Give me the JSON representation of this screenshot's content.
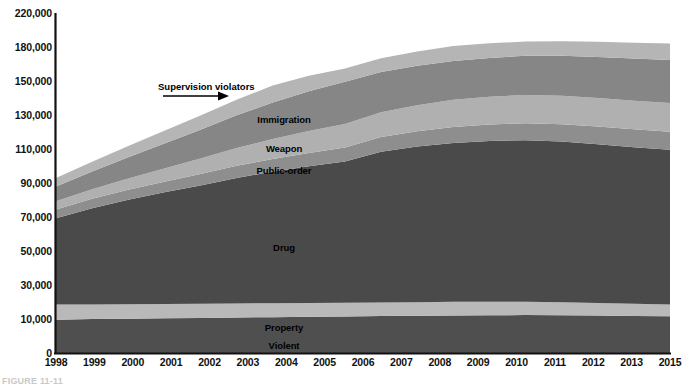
{
  "figure": {
    "caption": "FIGURE 11-11"
  },
  "chart_data": {
    "type": "area",
    "title": "",
    "subtitle": "",
    "xlabel": "",
    "ylabel": "",
    "stacked": true,
    "grid": false,
    "legend_position": "inline-labels",
    "ylim": [
      0,
      220000
    ],
    "ytick_labels": [
      "0",
      "10,000",
      "30,000",
      "50,000",
      "70,000",
      "90,000",
      "110,000",
      "130,000",
      "150,000",
      "180,000",
      "220,000"
    ],
    "ytick_values": [
      0,
      10000,
      30000,
      50000,
      70000,
      90000,
      110000,
      130000,
      150000,
      180000,
      220000
    ],
    "xtick_labels": [
      "1998",
      "1999",
      "2000",
      "2001",
      "2002",
      "2003",
      "2004",
      "2005",
      "2006",
      "2007",
      "2008",
      "2009",
      "2010",
      "2011",
      "2012",
      "2013",
      "2015"
    ],
    "x": [
      1998,
      1999,
      2000,
      2001,
      2002,
      2003,
      2004,
      2005,
      2006,
      2007,
      2008,
      2009,
      2010,
      2011,
      2012,
      2013,
      2014,
      2015
    ],
    "series": [
      {
        "name": "Violent",
        "color": "#4f4f4f",
        "values": [
          9800,
          10000,
          10200,
          10400,
          10600,
          10900,
          11100,
          11300,
          11500,
          11700,
          11900,
          12100,
          12200,
          12300,
          12200,
          12000,
          11800,
          11600
        ]
      },
      {
        "name": "Property",
        "color": "#b9b9b9",
        "values": [
          8700,
          8600,
          8500,
          8400,
          8300,
          8200,
          8200,
          8100,
          8100,
          8000,
          8000,
          8000,
          7900,
          7800,
          7600,
          7400,
          7200,
          7000
        ]
      },
      {
        "name": "Drug",
        "color": "#4a4a4a",
        "values": [
          50800,
          56600,
          61400,
          65700,
          69700,
          73900,
          77300,
          80400,
          83100,
          88700,
          91600,
          93500,
          94600,
          95100,
          94600,
          93400,
          92100,
          91000
        ]
      },
      {
        "name": "Public-order",
        "color": "#8e8e8e",
        "values": [
          5100,
          5500,
          5900,
          6300,
          6700,
          7100,
          7500,
          7900,
          8200,
          8600,
          9000,
          9400,
          9700,
          10000,
          10200,
          10400,
          10500,
          10600
        ]
      },
      {
        "name": "Weapon",
        "color": "#b0b0b0",
        "values": [
          4800,
          5600,
          6600,
          7700,
          9100,
          10500,
          11800,
          12900,
          13800,
          14600,
          15300,
          15900,
          16300,
          16600,
          16700,
          16800,
          16800,
          16800
        ]
      },
      {
        "name": "Immigration",
        "color": "#868686",
        "values": [
          8800,
          10500,
          12600,
          14700,
          16900,
          19200,
          21400,
          23300,
          24900,
          26300,
          27600,
          28800,
          29700,
          30400,
          30900,
          31200,
          31400,
          31500
        ]
      },
      {
        "name": "Supervision violators",
        "color": "#b5b5b5",
        "values": [
          4900,
          5700,
          6600,
          7500,
          8400,
          9200,
          10000,
          10700,
          11400,
          12100,
          12700,
          13400,
          13900,
          14300,
          14700,
          15000,
          15300,
          15500
        ]
      }
    ],
    "inline_labels": [
      {
        "name": "Immigration",
        "x_px": 284,
        "y_px": 115
      },
      {
        "name": "Weapon",
        "x_px": 284,
        "y_px": 144
      },
      {
        "name": "Public-order",
        "x_px": 284,
        "y_px": 166
      },
      {
        "name": "Drug",
        "x_px": 284,
        "y_px": 243
      },
      {
        "name": "Property",
        "x_px": 284,
        "y_px": 323
      },
      {
        "name": "Violent",
        "x_px": 284,
        "y_px": 341
      }
    ],
    "annotations": [
      {
        "text": "Supervision violators",
        "x_px": 158,
        "y_px": 82,
        "arrow": "right"
      }
    ]
  }
}
